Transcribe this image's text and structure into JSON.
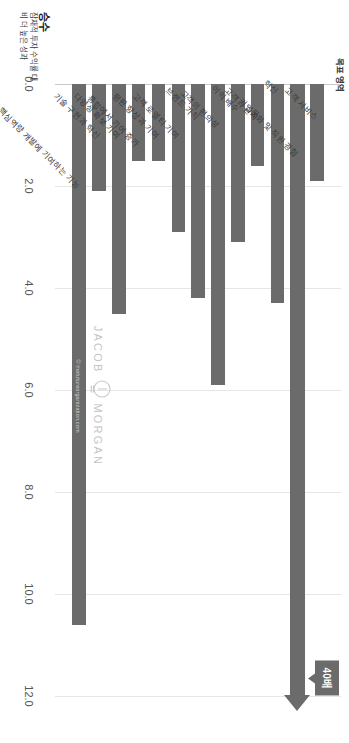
{
  "chart_data": {
    "type": "bar",
    "orientation": "horizontal",
    "title": "",
    "xlabel": "목표 영역",
    "ylabel": "승수",
    "ylabel_sub": "잠재적 투자 수익률 대비 더 높은 성과",
    "ylim": [
      0.0,
      12.0
    ],
    "ticks": [
      "0.0",
      "2.0",
      "4.0",
      "6.0",
      "8.0",
      "10.0",
      "12.0"
    ],
    "tick_values": [
      0,
      2,
      4,
      6,
      8,
      10,
      12
    ],
    "grid": true,
    "legend": "none",
    "bar_color": "#6b6b6b",
    "categories": [
      "고객 서비스",
      "기업문화 및 직원 경험",
      "혁신",
      "고객과 관계",
      "이익 배수",
      "고객의 편의성",
      "브랜드 가치",
      "고객 로열티 기여",
      "평판 향상과 기여",
      "통합에서 기여 증가",
      "다양성 확보 기여",
      "기술 구현과 혁신",
      "핵심역량 개발에 기여하는 기능"
    ],
    "values": [
      1.9,
      40.0,
      4.3,
      1.6,
      3.1,
      5.9,
      4.2,
      2.9,
      1.5,
      1.5,
      4.5,
      2.1,
      10.6
    ],
    "annotations": [
      {
        "label": "40배",
        "target_category": "기업문화 및 직원 경험",
        "value": 40.0,
        "note": "bar extends beyond axis maximum"
      }
    ]
  },
  "watermark": {
    "left": "JACOB",
    "right": "MORGAN",
    "url": "© thefutureorganization.com",
    "icon": "lightbulb-icon"
  }
}
